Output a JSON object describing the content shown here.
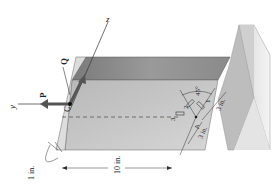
{
  "figure": {
    "labels": {
      "force_P": "P",
      "force_Q": "Q",
      "point_C": "C",
      "point_A": "A",
      "axis_y": "y",
      "axis_z": "z",
      "gage_1": "1",
      "gage_2": "2",
      "gage_3": "3",
      "angle": "45°",
      "dim_thickness": "1 in.",
      "dim_length": "10 in.",
      "dim_A_left": "3 in.",
      "dim_A_right": "3 in."
    },
    "colors": {
      "bar_top": "#8a8a8a",
      "bar_side": "#c4c4c4",
      "bar_end": "#dcdcdc",
      "wall": "#b0b0b0",
      "force_arrow": "#555555",
      "dim_lines": "#333333"
    }
  }
}
